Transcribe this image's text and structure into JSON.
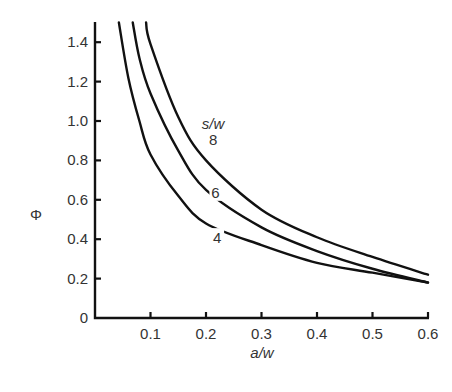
{
  "chart_data": {
    "type": "line",
    "title": "",
    "xlabel": "a/w",
    "ylabel": "Φ",
    "xlim": [
      0,
      0.6
    ],
    "ylim": [
      0,
      1.5
    ],
    "grid": false,
    "x_ticks": [
      "0.1",
      "0.2",
      "0.3",
      "0.4",
      "0.5",
      "0.6"
    ],
    "y_ticks": [
      "0",
      "0.2",
      "0.4",
      "0.6",
      "0.8",
      "1.0",
      "1.2",
      "1.4"
    ],
    "legend_title": "s/w",
    "series": [
      {
        "name": "4",
        "x": [
          0.043,
          0.06,
          0.08,
          0.1,
          0.15,
          0.2,
          0.3,
          0.4,
          0.5,
          0.6
        ],
        "y": [
          1.5,
          1.22,
          1.0,
          0.83,
          0.62,
          0.48,
          0.37,
          0.28,
          0.23,
          0.18
        ]
      },
      {
        "name": "6",
        "x": [
          0.068,
          0.08,
          0.1,
          0.15,
          0.2,
          0.3,
          0.4,
          0.5,
          0.6
        ],
        "y": [
          1.5,
          1.32,
          1.14,
          0.85,
          0.65,
          0.46,
          0.34,
          0.25,
          0.18
        ]
      },
      {
        "name": "8",
        "x": [
          0.092,
          0.1,
          0.15,
          0.2,
          0.3,
          0.4,
          0.5,
          0.6
        ],
        "y": [
          1.5,
          1.39,
          1.02,
          0.8,
          0.55,
          0.41,
          0.31,
          0.22
        ]
      }
    ],
    "annotations": [
      {
        "text": "s/w",
        "x": 0.213,
        "y": 1.0
      },
      {
        "text": "8",
        "x": 0.213,
        "y": 0.88
      },
      {
        "text": "6",
        "x": 0.217,
        "y": 0.61
      },
      {
        "text": "4",
        "x": 0.22,
        "y": 0.38
      }
    ]
  }
}
